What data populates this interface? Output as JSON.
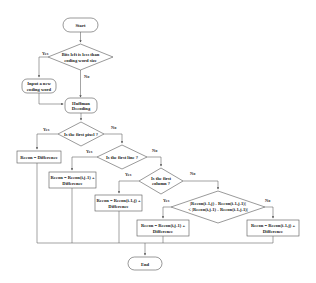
{
  "flowchart": {
    "start": "Start",
    "end": "End",
    "decision_bits": [
      "Bits left is less than",
      "coding word size"
    ],
    "input_new": [
      "Input a new",
      "coding word"
    ],
    "huffman": [
      "Huffman",
      "Decoding"
    ],
    "decision_first_pixel": "Is the first pixel ?",
    "recon_first": "Recon = Difference",
    "decision_first_line": "Is the first line ?",
    "recon_line": [
      "Recon = Recon(i,j-1) +",
      "Difference"
    ],
    "decision_first_column": [
      "Is the first",
      "column ?"
    ],
    "recon_column": [
      "Recon = Recon(i-1,j) +",
      "Difference"
    ],
    "decision_compare": [
      "|Recon(i-1,j) - Recon(i-1,j-1)|",
      "< |Recon(i,j-1) - Recon(i-1,j-1)|"
    ],
    "recon_left": [
      "Recon = Recon(i,j-1) +",
      "Difference"
    ],
    "recon_up": [
      "Recon = Recon(i-1,j) +",
      "Difference"
    ],
    "labels": {
      "yes": "Yes",
      "no": "No"
    }
  }
}
